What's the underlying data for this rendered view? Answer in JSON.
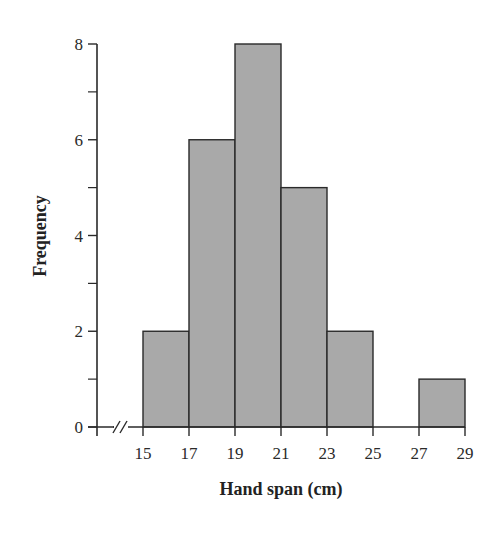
{
  "chart_data": {
    "type": "bar",
    "subtype": "histogram",
    "title": "",
    "xlabel": "Hand span (cm)",
    "ylabel": "Frequency",
    "bins": [
      {
        "start": 15,
        "end": 17,
        "count": 2
      },
      {
        "start": 17,
        "end": 19,
        "count": 6
      },
      {
        "start": 19,
        "end": 21,
        "count": 8
      },
      {
        "start": 21,
        "end": 23,
        "count": 5
      },
      {
        "start": 23,
        "end": 25,
        "count": 2
      },
      {
        "start": 25,
        "end": 27,
        "count": 0
      },
      {
        "start": 27,
        "end": 29,
        "count": 1
      }
    ],
    "categories": [
      "15-17",
      "17-19",
      "19-21",
      "21-23",
      "23-25",
      "25-27",
      "27-29"
    ],
    "values": [
      2,
      6,
      8,
      5,
      2,
      0,
      1
    ],
    "x_ticks": [
      15,
      17,
      19,
      21,
      23,
      25,
      27,
      29
    ],
    "y_ticks_major": [
      0,
      2,
      4,
      6,
      8
    ],
    "y_ticks_minor": [
      1,
      3,
      5,
      7
    ],
    "xlim": [
      13,
      29
    ],
    "ylim": [
      0,
      8
    ],
    "x_axis_break": true,
    "grid": false,
    "legend": null,
    "colors": {
      "bar_fill": "#a9a9a9",
      "bar_edge": "#2a2a2a",
      "axis": "#2a2a2a"
    }
  }
}
